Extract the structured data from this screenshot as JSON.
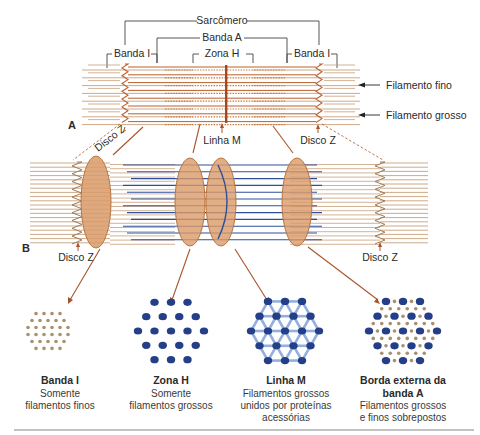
{
  "figure": {
    "panels": {
      "a": "A",
      "b": "B"
    },
    "colors": {
      "thin_filament": "#c8a07a",
      "thick_filament_top": "#b9602f",
      "thick_filament_blue": "#2f4f9c",
      "m_line": "#a8471f",
      "disc_fill": "#d99a68",
      "disc_edge": "#b8753f",
      "arrow": "#a8542a",
      "bracket": "#444444",
      "rule": "#888888"
    },
    "top_labels": {
      "sarcomere": "Sarcômero",
      "a_band": "Banda A",
      "i_band_left": "Banda I",
      "h_zone": "Zona H",
      "i_band_right": "Banda I",
      "thin_filament": "Filamento fino",
      "thick_filament": "Filamento grosso",
      "m_line": "Linha M",
      "z_disc_top": "Disco Z",
      "z_disc_diagonal": "Disco Z"
    },
    "bottom_labels": {
      "z_disc_left": "Disco Z",
      "z_disc_right": "Disco Z"
    },
    "cross_sections": [
      {
        "title": [
          "Banda I"
        ],
        "desc": [
          "Somente",
          "filamentos finos"
        ],
        "pattern": "thin-only"
      },
      {
        "title": [
          "Zona H"
        ],
        "desc": [
          "Somente",
          "filamentos grossos"
        ],
        "pattern": "thick-only"
      },
      {
        "title": [
          "Linha M"
        ],
        "desc": [
          "Filamentos grossos",
          "unidos por proteínas",
          "acessórias"
        ],
        "pattern": "thick-linked"
      },
      {
        "title": [
          "Borda externa da",
          "banda A"
        ],
        "desc": [
          "Filamentos grossos",
          "e finos sobrepostos"
        ],
        "pattern": "overlap"
      }
    ]
  }
}
